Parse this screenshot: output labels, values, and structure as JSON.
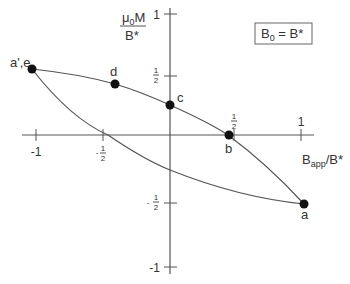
{
  "figure": {
    "y_axis_label": {
      "numerator_mu": "μ",
      "numerator_sub": "0",
      "numerator_rest": "M",
      "denominator": "B*"
    },
    "x_axis_label": {
      "base": "B",
      "sub": "app",
      "rest": "/B*"
    },
    "condition_box": {
      "left": "B",
      "left_sub": "0",
      "rest": " = B*"
    },
    "y_ticks": {
      "one": "1",
      "half": {
        "sign": "",
        "num": "1",
        "den": "2"
      },
      "neg_half": {
        "sign": "-",
        "num": "1",
        "den": "2"
      },
      "neg_one": "-1"
    },
    "x_ticks": {
      "neg_one": "-1",
      "neg_half": {
        "sign": "-",
        "num": "1",
        "den": "2"
      },
      "half": {
        "num": "1",
        "den": "2"
      },
      "one": "1"
    },
    "points": [
      {
        "label": "a',e",
        "x": -1.0,
        "y": 0.55
      },
      {
        "label": "d",
        "x": -0.4,
        "y": 0.42
      },
      {
        "label": "c",
        "x": 0.0,
        "y": 0.25
      },
      {
        "label": "b",
        "x": 0.45,
        "y": 0.0
      },
      {
        "label": "a",
        "x": 1.0,
        "y": -0.5
      }
    ],
    "colors": {
      "axis": "#555555",
      "point": "#111111",
      "text": "#333333"
    }
  }
}
